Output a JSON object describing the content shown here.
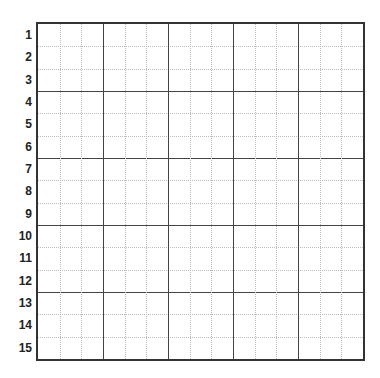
{
  "grid": {
    "rows": 15,
    "major_columns": 5,
    "sub_columns_per_major": 3,
    "major_row_every": 3,
    "row_labels": [
      "1",
      "2",
      "3",
      "4",
      "5",
      "6",
      "7",
      "8",
      "9",
      "10",
      "11",
      "12",
      "13",
      "14",
      "15"
    ],
    "colors": {
      "border": "#333333",
      "major_line": "#444444",
      "minor_line": "#bdbdbd",
      "label": "#222222"
    }
  }
}
